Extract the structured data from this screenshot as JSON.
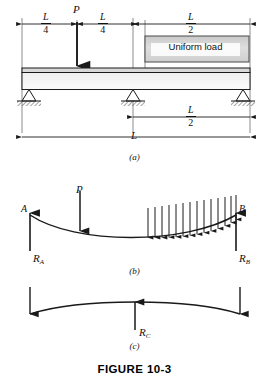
{
  "figure": {
    "caption": "FIGURE 10-3",
    "panels": [
      {
        "tag": "(a)",
        "name": "loaded-beam-schematic"
      },
      {
        "tag": "(b)",
        "name": "free-body-two-reactions"
      },
      {
        "tag": "(c)",
        "name": "free-body-center-reaction"
      }
    ]
  },
  "panel_a": {
    "point_load_label": "P",
    "uniform_load_label": "Uniform load",
    "dimensions": [
      {
        "name": "dim-quarter-left",
        "numerator": "L",
        "denominator": "4"
      },
      {
        "name": "dim-quarter-right",
        "numerator": "L",
        "denominator": "4"
      },
      {
        "name": "dim-half-top",
        "numerator": "L",
        "denominator": "2"
      },
      {
        "name": "dim-half-lower",
        "numerator": "L",
        "denominator": "2"
      }
    ],
    "span_label": "L",
    "supports": [
      {
        "name": "support-left",
        "type": "pinned"
      },
      {
        "name": "support-center",
        "type": "pinned"
      },
      {
        "name": "support-right",
        "type": "pinned"
      }
    ]
  },
  "panel_b": {
    "node_left": "A",
    "node_right": "B",
    "point_load_label": "P",
    "reaction_left": {
      "symbol": "R",
      "subscript": "A"
    },
    "reaction_right": {
      "symbol": "R",
      "subscript": "B"
    },
    "distributed_arrow_count": 14
  },
  "panel_c": {
    "reaction_center": {
      "symbol": "R",
      "subscript": "C"
    }
  },
  "colors": {
    "line": "#1a1a1a",
    "beam_fill": "#f2f2f2",
    "load_box_fill": "#d4d4d4",
    "hatch": "#555555",
    "background": "#ffffff"
  }
}
